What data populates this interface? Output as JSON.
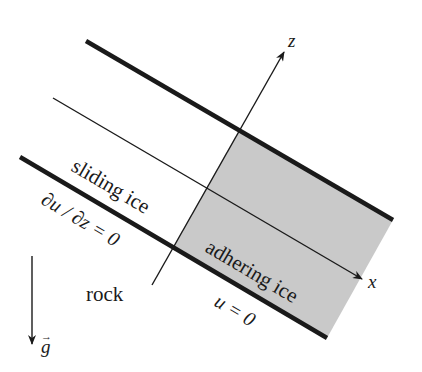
{
  "diagram": {
    "title": "",
    "colors": {
      "line": "#1a1a1a",
      "adhering_fill": "#c9c9c9",
      "background": "#ffffff"
    },
    "axes": {
      "x_label": "x",
      "z_label": "z"
    },
    "regions": {
      "sliding": "sliding ice",
      "adhering": "adhering ice",
      "rock": "rock"
    },
    "boundary_conditions": {
      "sliding": "∂u / ∂z = 0",
      "adhering": "u = 0"
    },
    "gravity": {
      "label": "g",
      "vector_mark": "→"
    }
  }
}
